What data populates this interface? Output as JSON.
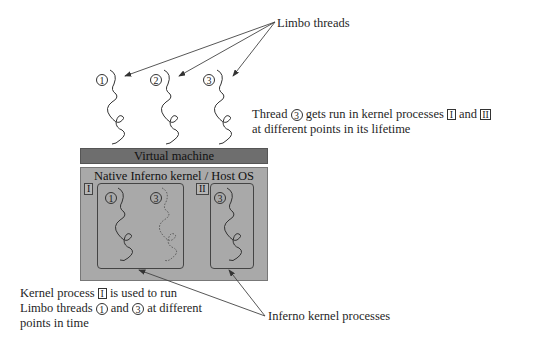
{
  "labels": {
    "limbo_threads": "Limbo threads",
    "thread3_note": {
      "line1_prefix": "Thread",
      "thread_num": "3",
      "line1_middle": "gets run in kernel processes",
      "proc_a": "I",
      "and": "and",
      "proc_b": "II",
      "line2": "at different points in its lifetime"
    },
    "kernel_note": {
      "line1_prefix": "Kernel process",
      "proc": "I",
      "line1_suffix": "is used to run",
      "line2_prefix": "Limbo threads",
      "thread_a": "1",
      "and": "and",
      "thread_b": "3",
      "line2_suffix": "at different",
      "line3": "points in time"
    },
    "inferno_processes": "Inferno kernel processes"
  },
  "layers": {
    "virtual_machine": "Virtual machine",
    "kernel": "Native Inferno kernel / Host OS"
  },
  "threads": [
    {
      "id": "1",
      "label": "1"
    },
    {
      "id": "2",
      "label": "2"
    },
    {
      "id": "3",
      "label": "3"
    }
  ],
  "processes": [
    {
      "id": "I",
      "label": "I",
      "threads": [
        {
          "label": "1",
          "style": "solid"
        },
        {
          "label": "3",
          "style": "dotted"
        }
      ]
    },
    {
      "id": "II",
      "label": "II",
      "threads": [
        {
          "label": "3",
          "style": "solid"
        }
      ]
    }
  ],
  "colors": {
    "vm_bar": "#6e6e6e",
    "kernel_bg": "#a9a9a9",
    "line": "#333333"
  }
}
